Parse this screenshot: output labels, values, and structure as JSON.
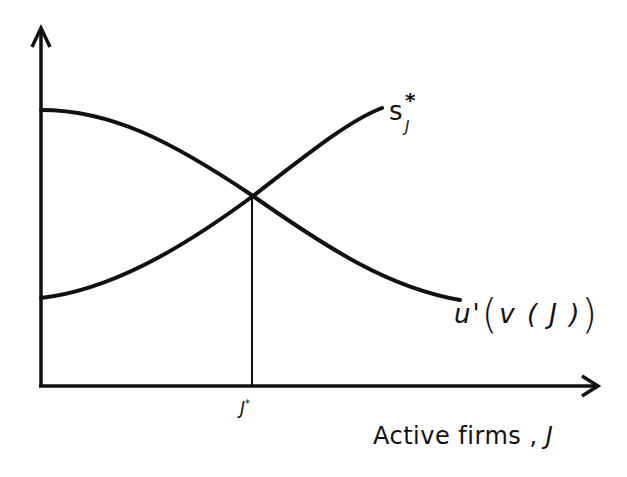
{
  "diagram": {
    "x_axis": {
      "label_text": "Active firms ,",
      "label_variable": "J",
      "tick_label_base": "J",
      "tick_label_sup": "*"
    },
    "y_axis": {
      "label_text": ""
    },
    "curves": [
      {
        "name": "s_J*",
        "label_base": "s",
        "label_sup": "*",
        "label_sub": "J",
        "shape": "increasing",
        "start": [
          41,
          298
        ],
        "end": [
          382,
          108
        ]
      },
      {
        "name": "u'(v(J))",
        "label_prefix": "u'",
        "label_open": "(",
        "label_inner": "v ( J )",
        "label_close": ")",
        "shape": "decreasing",
        "start": [
          41,
          110
        ],
        "end": [
          460,
          300
        ]
      }
    ],
    "intersection": {
      "x_label": "J*",
      "point": [
        253,
        196
      ]
    },
    "colors": {
      "ink": "#111111",
      "background": "#ffffff"
    }
  }
}
